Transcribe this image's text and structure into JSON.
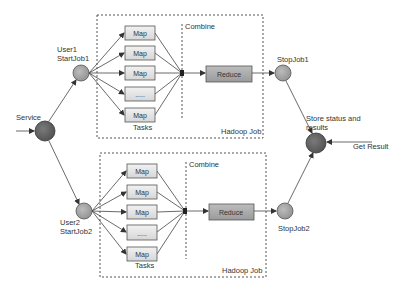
{
  "colors": {
    "line": "#444444",
    "map_fill": "#e6e6e6",
    "reduce_fill": "#a9a9a9",
    "node_light": "#a8a8a8",
    "node_dark": "#6a6a6a",
    "text": "#333333"
  },
  "nodes": {
    "service": {
      "label": "Service"
    },
    "user1": {
      "label_line1": "User1",
      "label_line2": "StartJob1"
    },
    "user2": {
      "label_line1": "User2",
      "label_line2": "StartJob2"
    },
    "stop1": {
      "label": "StopJob1"
    },
    "stop2": {
      "label": "StopJob2"
    },
    "store": {
      "label_line1": "Store status and",
      "label_line2": "results"
    },
    "get_result": {
      "label": "Get Result"
    }
  },
  "jobs": [
    {
      "title": "Hadoop Job",
      "combine_label": "Combine",
      "tasks_label": "Tasks",
      "maps": [
        "Map",
        "Map",
        "Map",
        ".....",
        "Map"
      ],
      "reduce_label": "Reduce"
    },
    {
      "title": "Hadoop Job",
      "combine_label": "Combine",
      "tasks_label": "Tasks",
      "maps": [
        "Map",
        "Map",
        "Map",
        ".....",
        "Map"
      ],
      "reduce_label": "Reduce"
    }
  ]
}
